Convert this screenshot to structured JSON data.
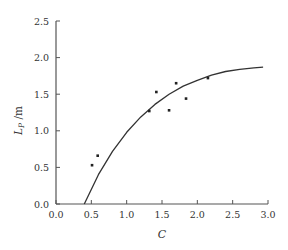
{
  "chart_data": {
    "type": "scatter",
    "title": "",
    "xlabel": "C",
    "ylabel_main": "L",
    "ylabel_sub": "P",
    "ylabel_unit": "/m",
    "xlim": [
      0.0,
      3.0
    ],
    "ylim": [
      0.0,
      2.5
    ],
    "xticks": [
      "0.0",
      "0.5",
      "1.0",
      "1.5",
      "2.0",
      "2.5",
      "3.0"
    ],
    "yticks": [
      "0.0",
      "0.5",
      "1.0",
      "1.5",
      "2.0",
      "2.5"
    ],
    "grid": false,
    "legend": null,
    "series": [
      {
        "name": "measured",
        "kind": "scatter",
        "points": [
          [
            0.51,
            0.53
          ],
          [
            0.59,
            0.66
          ],
          [
            1.32,
            1.27
          ],
          [
            1.42,
            1.53
          ],
          [
            1.6,
            1.28
          ],
          [
            1.7,
            1.65
          ],
          [
            1.84,
            1.44
          ],
          [
            2.15,
            1.72
          ]
        ]
      },
      {
        "name": "fitted curve",
        "kind": "line",
        "points": [
          [
            0.4,
            0.0
          ],
          [
            0.6,
            0.4
          ],
          [
            0.8,
            0.72
          ],
          [
            1.0,
            0.98
          ],
          [
            1.2,
            1.19
          ],
          [
            1.4,
            1.36
          ],
          [
            1.6,
            1.5
          ],
          [
            1.8,
            1.61
          ],
          [
            2.0,
            1.69
          ],
          [
            2.2,
            1.76
          ],
          [
            2.4,
            1.81
          ],
          [
            2.6,
            1.84
          ],
          [
            2.8,
            1.86
          ],
          [
            2.93,
            1.87
          ]
        ]
      }
    ]
  },
  "colors": {
    "axis": "#555555",
    "line": "#333333",
    "point": "#222222"
  }
}
